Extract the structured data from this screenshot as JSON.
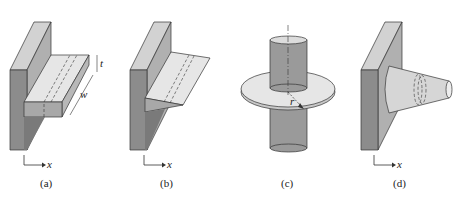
{
  "figure": {
    "panels": [
      {
        "id": "a",
        "caption": "(a)",
        "axis_label": "x",
        "dimension_labels": {
          "thickness": "t",
          "width": "w"
        },
        "description": "T-shaped rectangular fin on wall"
      },
      {
        "id": "b",
        "caption": "(b)",
        "axis_label": "x",
        "description": "Triangular (tapered) straight fin on wall"
      },
      {
        "id": "c",
        "caption": "(c)",
        "radius_label": "r",
        "description": "Annular fin on cylinder"
      },
      {
        "id": "d",
        "caption": "(d)",
        "axis_label": "x",
        "description": "Conical pin fin on wall"
      }
    ],
    "colors": {
      "wall_front": "#8c8c8c",
      "wall_side": "#b0b0b0",
      "wall_top": "#d2d2d2",
      "fin_top": "#e6e6e6",
      "fin_front": "#a8a8a8",
      "outline": "#333333"
    }
  }
}
